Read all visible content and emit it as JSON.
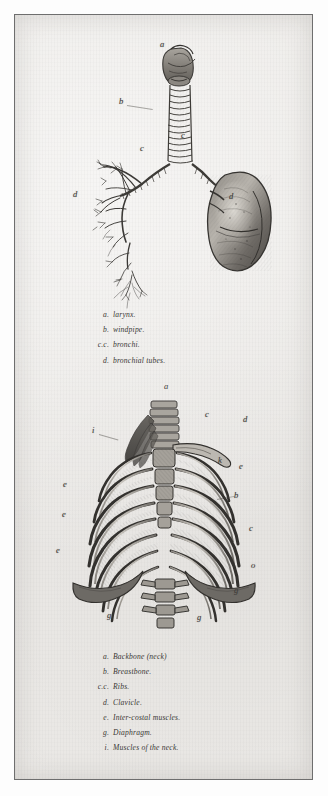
{
  "plate": {
    "paper_color": "#eceae7",
    "ink_color": "#3c3a37",
    "border_color": "#6e6e6e"
  },
  "figure1": {
    "name": "respiratory-tract",
    "labels": [
      {
        "letter": "a",
        "x": 159,
        "y": 39
      },
      {
        "letter": "b",
        "x": 118,
        "y": 96
      },
      {
        "letter": "c",
        "x": 180,
        "y": 130
      },
      {
        "letter": "c",
        "x": 139,
        "y": 143
      },
      {
        "letter": "d",
        "x": 72,
        "y": 189
      },
      {
        "letter": "d",
        "x": 228,
        "y": 191
      }
    ],
    "key": [
      {
        "mark": "a.",
        "text": "larynx."
      },
      {
        "mark": "b.",
        "text": "windpipe."
      },
      {
        "mark": "c.c.",
        "text": "bronchi."
      },
      {
        "mark": "d.",
        "text": "bronchial tubes."
      }
    ]
  },
  "figure2": {
    "name": "thoracic-skeleton",
    "plate_letter": "a",
    "labels": [
      {
        "letter": "a",
        "x": 163,
        "y": 381
      },
      {
        "letter": "i",
        "x": 91,
        "y": 425
      },
      {
        "letter": "c",
        "x": 204,
        "y": 409
      },
      {
        "letter": "d",
        "x": 242,
        "y": 414
      },
      {
        "letter": "k",
        "x": 217,
        "y": 455
      },
      {
        "letter": "e",
        "x": 238,
        "y": 461
      },
      {
        "letter": "b",
        "x": 233,
        "y": 490
      },
      {
        "letter": "c",
        "x": 248,
        "y": 523
      },
      {
        "letter": "e",
        "x": 62,
        "y": 479
      },
      {
        "letter": "e",
        "x": 61,
        "y": 509
      },
      {
        "letter": "e",
        "x": 55,
        "y": 545
      },
      {
        "letter": "o",
        "x": 250,
        "y": 560
      },
      {
        "letter": "g",
        "x": 233,
        "y": 585
      },
      {
        "letter": "g",
        "x": 106,
        "y": 610
      },
      {
        "letter": "g",
        "x": 196,
        "y": 612
      }
    ],
    "key": [
      {
        "mark": "a.",
        "text": "Backbone (neck)"
      },
      {
        "mark": "b.",
        "text": "Breastbone."
      },
      {
        "mark": "c.c.",
        "text": "Ribs."
      },
      {
        "mark": "d.",
        "text": "Clavicle."
      },
      {
        "mark": "e.",
        "text": "Inter-costal muscles."
      },
      {
        "mark": "g.",
        "text": "Diaphragm."
      },
      {
        "mark": "i.",
        "text": "Muscles of the neck."
      }
    ]
  }
}
